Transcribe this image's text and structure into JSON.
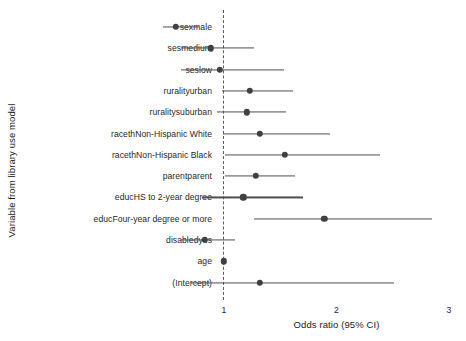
{
  "chart_data": {
    "type": "scatter",
    "subtype": "forest-plot",
    "title": "",
    "xlabel": "Odds ratio (95% CI)",
    "ylabel": "Variable from library use model",
    "xlim": [
      0.38,
      3.14
    ],
    "xticks": [
      1,
      2,
      3
    ],
    "xtick_labels": [
      "1",
      "2",
      "3"
    ],
    "grid": false,
    "legend": "none",
    "reference_line": {
      "value": 1,
      "style": "dashed",
      "color": "#595959"
    },
    "point_color": "#404040",
    "line_color": "#4d4d4d",
    "categories": [
      "sexmale",
      "sesmedium",
      "seslow",
      "ruralityurban",
      "ruralitysuburban",
      "racethNon-Hispanic White",
      "racethNon-Hispanic Black",
      "parentparent",
      "educHS to 2-year degree",
      "educFour-year degree or more",
      "disabledyes",
      "age",
      "(Intercept)"
    ],
    "points": [
      {
        "label": "sexmale",
        "estimate": 0.57,
        "low": 0.46,
        "high": 0.78
      },
      {
        "label": "sesmedium",
        "estimate": 0.88,
        "low": 0.62,
        "high": 1.27
      },
      {
        "label": "seslow",
        "estimate": 0.96,
        "low": 0.62,
        "high": 1.53
      },
      {
        "label": "ruralityurban",
        "estimate": 1.23,
        "low": 0.98,
        "high": 1.61
      },
      {
        "label": "ruralitysuburban",
        "estimate": 1.2,
        "low": 0.94,
        "high": 1.55
      },
      {
        "label": "racethNon-Hispanic White",
        "estimate": 1.32,
        "low": 0.99,
        "high": 1.94
      },
      {
        "label": "racethNon-Hispanic Black",
        "estimate": 1.54,
        "low": 1.01,
        "high": 2.39
      },
      {
        "label": "parentparent",
        "estimate": 1.28,
        "low": 1.01,
        "high": 1.63
      },
      {
        "label": "educHS to 2-year degree",
        "estimate": 1.17,
        "low": 0.8,
        "high": 1.7
      },
      {
        "label": "educFour-year degree or more",
        "estimate": 1.89,
        "low": 1.27,
        "high": 2.85
      },
      {
        "label": "disabledyes",
        "estimate": 0.83,
        "low": 0.62,
        "high": 1.1
      },
      {
        "label": "age",
        "estimate": 1.0,
        "low": 0.99,
        "high": 1.01
      },
      {
        "label": "(Intercept)",
        "estimate": 1.32,
        "low": 0.71,
        "high": 2.51
      }
    ]
  }
}
